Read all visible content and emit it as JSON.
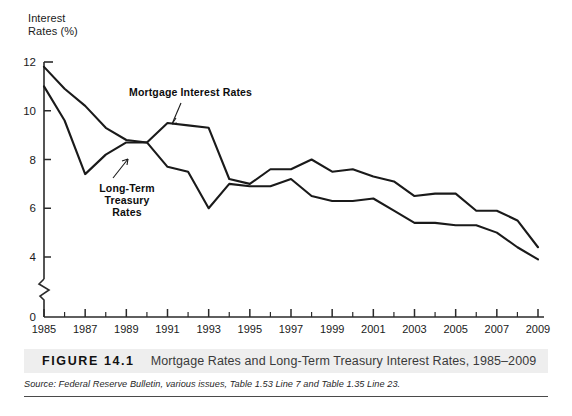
{
  "figure": {
    "number": "FIGURE 14.1",
    "caption": "Mortgage Rates and Long-Term Treasury Interest Rates, 1985–2009",
    "source_prefix": "Source: Federal Reserve Bulletin",
    "source_rest": ", various issues, Table 1.53 Line 7 and Table 1.35 Line 23."
  },
  "labels": {
    "mortgage": "Mortgage Interest Rates",
    "treasury": "Long-Term\nTreasury\nRates"
  },
  "chart_data": {
    "type": "line",
    "title": "Mortgage Rates and Long-Term Treasury Interest Rates, 1985–2009",
    "xlabel": "",
    "ylabel": "Interest\nRates (%)",
    "ylim": [
      0,
      12
    ],
    "xlim": [
      1985,
      2009
    ],
    "grid": false,
    "legend_position": "inline-annotation",
    "y_axis_break": true,
    "y_axis_break_between": [
      0,
      4
    ],
    "yticks": [
      0,
      4,
      6,
      8,
      10,
      12
    ],
    "ytick_labels": [
      "0",
      "4",
      "6",
      "8",
      "10",
      "12"
    ],
    "xticks": [
      1985,
      1987,
      1989,
      1991,
      1993,
      1995,
      1997,
      1999,
      2001,
      2003,
      2005,
      2007,
      2009
    ],
    "xtick_labels": [
      "1985",
      "1987",
      "1989",
      "1991",
      "1993",
      "1995",
      "1997",
      "1999",
      "2001",
      "2003",
      "2005",
      "2007",
      "2009"
    ],
    "x": [
      1985,
      1986,
      1987,
      1988,
      1989,
      1990,
      1991,
      1992,
      1993,
      1994,
      1995,
      1996,
      1997,
      1998,
      1999,
      2000,
      2001,
      2002,
      2003,
      2004,
      2005,
      2006,
      2007,
      2008,
      2009
    ],
    "series": [
      {
        "name": "Mortgage Interest Rates",
        "values": [
          11.8,
          10.9,
          10.2,
          9.3,
          8.8,
          8.7,
          9.5,
          9.4,
          9.3,
          7.2,
          7.0,
          7.6,
          7.6,
          8.0,
          7.5,
          7.6,
          7.3,
          7.1,
          6.5,
          6.6,
          6.6,
          5.9,
          5.9,
          5.5,
          4.4
        ],
        "style": "solid",
        "color": "#1a1a1a"
      },
      {
        "name": "Long-Term Treasury Rates",
        "values": [
          11.0,
          9.6,
          7.4,
          8.2,
          8.7,
          8.7,
          7.7,
          7.5,
          6.0,
          7.0,
          6.9,
          6.9,
          7.2,
          6.5,
          6.3,
          6.3,
          6.4,
          5.9,
          5.4,
          5.4,
          5.3,
          5.3,
          5.0,
          4.4,
          3.9
        ],
        "style": "solid",
        "color": "#1a1a1a"
      }
    ]
  },
  "colors": {
    "line": "#1a1a1a",
    "axis": "#2a2a2a",
    "caption_band": "#eeeeee",
    "background": "#ffffff"
  }
}
